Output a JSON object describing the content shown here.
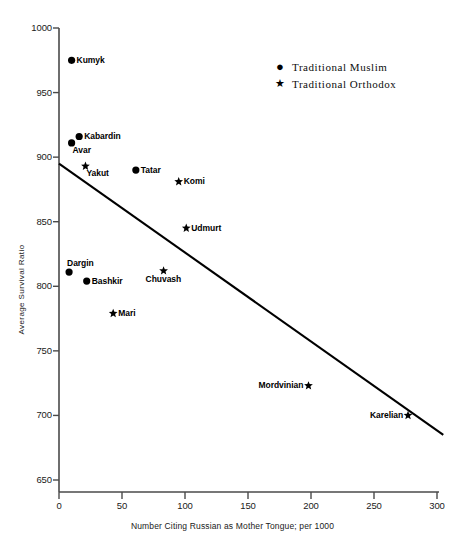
{
  "chart_data": {
    "type": "scatter",
    "title": "",
    "xlabel": "Number Citing Russian as Mother Tongue; per 1000",
    "ylabel": "Average Survival Ratio",
    "xlim": [
      0,
      300
    ],
    "ylim": [
      650,
      1000
    ],
    "xticks": [
      0,
      50,
      100,
      150,
      200,
      250,
      300
    ],
    "yticks": [
      650,
      700,
      750,
      800,
      850,
      900,
      950,
      1000
    ],
    "xtick_labels": [
      "0",
      "50",
      "100",
      "150",
      "200",
      "250",
      "300"
    ],
    "ytick_labels": [
      "650",
      "700",
      "750",
      "800",
      "850",
      "900",
      "950",
      "1000"
    ],
    "grid": false,
    "legend_position": "upper-right-outside",
    "legend": [
      {
        "marker": "circle",
        "glyph": "●",
        "label": "Traditional Muslim"
      },
      {
        "marker": "star",
        "glyph": "★",
        "label": "Traditional Orthodox"
      }
    ],
    "series": [
      {
        "name": "Traditional Muslim",
        "marker": "circle",
        "points": [
          {
            "label": "Kumyk",
            "x": 10,
            "y": 975,
            "label_pos": "right"
          },
          {
            "label": "Kabardin",
            "x": 16,
            "y": 916,
            "label_pos": "right"
          },
          {
            "label": "Avar",
            "x": 10,
            "y": 911,
            "label_pos": "below-right"
          },
          {
            "label": "Dargin",
            "x": 8,
            "y": 811,
            "label_pos": "above-right"
          },
          {
            "label": "Bashkir",
            "x": 22,
            "y": 804,
            "label_pos": "right"
          },
          {
            "label": "Tatar",
            "x": 61,
            "y": 890,
            "label_pos": "right"
          }
        ]
      },
      {
        "name": "Traditional Orthodox",
        "marker": "star",
        "points": [
          {
            "label": "Yakut",
            "x": 21,
            "y": 893,
            "label_pos": "below-right"
          },
          {
            "label": "Komi",
            "x": 95,
            "y": 881,
            "label_pos": "right"
          },
          {
            "label": "Udmurt",
            "x": 101,
            "y": 845,
            "label_pos": "right"
          },
          {
            "label": "Chuvash",
            "x": 83,
            "y": 812,
            "label_pos": "below-center"
          },
          {
            "label": "Mari",
            "x": 43,
            "y": 779,
            "label_pos": "right"
          },
          {
            "label": "Mordvinian",
            "x": 198,
            "y": 723,
            "label_pos": "left"
          },
          {
            "label": "Karelian",
            "x": 277,
            "y": 700,
            "label_pos": "left"
          }
        ]
      }
    ],
    "trendline": {
      "type": "linear-fit",
      "x_start": 0,
      "y_start": 895,
      "x_end": 305,
      "y_end": 685
    }
  },
  "caption_fragment": ""
}
